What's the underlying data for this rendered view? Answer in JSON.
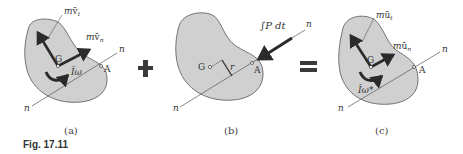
{
  "figure": {
    "number": "Fig. 17.11",
    "operators": {
      "plus": "+",
      "equals": "="
    },
    "colors": {
      "body_fill": "#d0d0d0",
      "outline": "#555555",
      "vector": "#2b2b2b",
      "line": "#555555"
    },
    "panels": [
      {
        "id": "a",
        "caption": "(a)",
        "point_center": "G",
        "point_contact": "A",
        "line_of_impact": {
          "label_upper": "n",
          "label_lower": "n"
        },
        "vectors": [
          {
            "label_base": "m",
            "label_symbol": "v̄",
            "label_sub": "t"
          },
          {
            "label_base": "m",
            "label_symbol": "v̄",
            "label_sub": "n"
          }
        ],
        "couple": {
          "label": "Īω"
        }
      },
      {
        "id": "b",
        "caption": "(b)",
        "point_center": "G",
        "point_contact": "A",
        "line_of_impact": {
          "label_upper": "n",
          "label_lower": "n"
        },
        "impulse": {
          "label": "∫P dt"
        },
        "distance": {
          "label": "r"
        }
      },
      {
        "id": "c",
        "caption": "(c)",
        "point_center": "G",
        "point_contact": "A",
        "line_of_impact": {
          "label_upper": "n",
          "label_lower": "n"
        },
        "vectors": [
          {
            "label_base": "m",
            "label_symbol": "ū",
            "label_sub": "t"
          },
          {
            "label_base": "m",
            "label_symbol": "ū",
            "label_sub": "n"
          }
        ],
        "couple": {
          "label": "Īω*"
        }
      }
    ]
  }
}
